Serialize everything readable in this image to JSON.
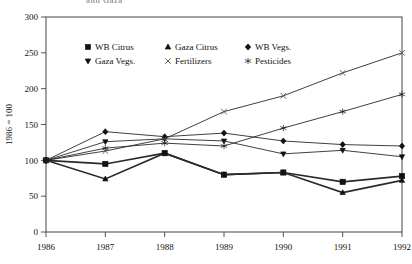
{
  "figure": {
    "clipped_title": "and Gaza",
    "axis_ylabel": "1986 = 100"
  },
  "legend": {
    "entries": [
      {
        "label": "WB Citrus",
        "marker": "filled-square-icon",
        "key": "wb_citrus"
      },
      {
        "label": "Gaza Citrus",
        "marker": "filled-triangle-up-icon",
        "key": "gaza_citrus"
      },
      {
        "label": "WB Vegs.",
        "marker": "filled-diamond-icon",
        "key": "wb_vegs"
      },
      {
        "label": "Gaza Vegs.",
        "marker": "filled-triangle-down-icon",
        "key": "gaza_vegs"
      },
      {
        "label": "Fertilizers",
        "marker": "cross-x-icon",
        "key": "fertilizers"
      },
      {
        "label": "Pesticides",
        "marker": "star-icon",
        "key": "pesticides"
      }
    ]
  },
  "chart_data": {
    "type": "line",
    "title": "",
    "xlabel": "",
    "ylabel": "1986 = 100",
    "x": [
      1986,
      1987,
      1988,
      1989,
      1990,
      1991,
      1992
    ],
    "xtick_labels": [
      "1986",
      "1987",
      "1988",
      "1989",
      "1990",
      "1991",
      "1992"
    ],
    "ytick_labels": [
      "0",
      "50",
      "100",
      "150",
      "200",
      "250",
      "300"
    ],
    "yticks": [
      0,
      50,
      100,
      150,
      200,
      250,
      300
    ],
    "ylim": [
      0,
      300
    ],
    "grid": false,
    "legend_position": "upper-left-inside",
    "series": [
      {
        "name": "WB Citrus",
        "marker": "filled-square",
        "values": [
          100,
          95,
          110,
          80,
          83,
          70,
          78
        ]
      },
      {
        "name": "Gaza Citrus",
        "marker": "filled-triangle-up",
        "values": [
          100,
          74,
          110,
          80,
          83,
          55,
          72
        ]
      },
      {
        "name": "WB Vegs.",
        "marker": "filled-diamond",
        "values": [
          100,
          140,
          133,
          138,
          127,
          122,
          120
        ]
      },
      {
        "name": "Gaza Vegs.",
        "marker": "filled-triangle-down",
        "values": [
          100,
          126,
          130,
          127,
          109,
          114,
          105
        ]
      },
      {
        "name": "Fertilizers",
        "marker": "cross-x",
        "values": [
          100,
          113,
          130,
          168,
          190,
          222,
          250
        ]
      },
      {
        "name": "Pesticides",
        "marker": "star",
        "values": [
          100,
          117,
          124,
          120,
          145,
          168,
          192
        ]
      }
    ]
  }
}
